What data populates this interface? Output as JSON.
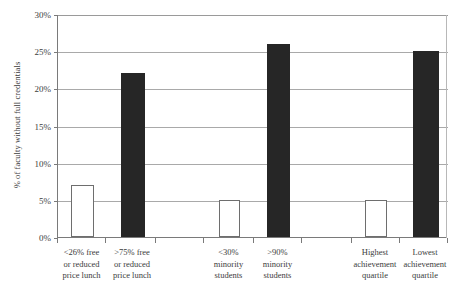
{
  "chart_data": {
    "type": "bar",
    "title": "",
    "xlabel": "",
    "ylabel": "% of faculty without full credentials",
    "ylim": [
      0,
      30
    ],
    "yticks": [
      "0%",
      "5%",
      "10%",
      "15%",
      "20%",
      "25%",
      "30%"
    ],
    "ytick_values": [
      0,
      5,
      10,
      15,
      20,
      25,
      30
    ],
    "grid": "horizontal",
    "legend": "none",
    "categories": [
      "<26% free or reduced price lunch",
      ">75% free or reduced price lunch",
      "<30% minority students",
      ">90% minority students",
      "Highest achievement quartile",
      "Lowest achievement quartile"
    ],
    "category_lines": [
      [
        "<26% free",
        "or reduced",
        "price lunch"
      ],
      [
        ">75%  free",
        "or reduced",
        "price lunch"
      ],
      [
        "<30%",
        "minority",
        "students"
      ],
      [
        ">90%",
        "minority",
        "students"
      ],
      [
        "Highest",
        "achievement",
        "quartile"
      ],
      [
        "Lowest",
        "achievement",
        "quartile"
      ]
    ],
    "values": [
      7,
      22,
      5,
      26,
      5,
      25
    ],
    "bar_styles": [
      "open",
      "filled",
      "open",
      "filled",
      "open",
      "filled"
    ],
    "colors": {
      "open_fill": "#ffffff",
      "open_border": "#6e6e6e",
      "filled": "#262626",
      "gridline": "#a9a9a9",
      "axis": "#7a7a7a",
      "text": "#3c3c3c",
      "background": "#ffffff"
    }
  }
}
